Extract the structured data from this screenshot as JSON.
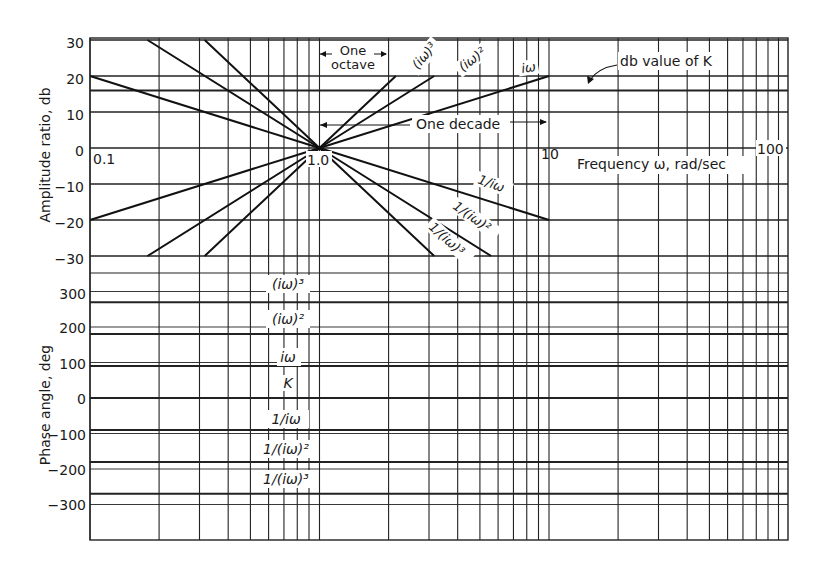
{
  "chart_data": {
    "type": "line",
    "title": "",
    "xlabel": "Frequency ω, rad/sec",
    "xscale": "log",
    "xlim": [
      0.1,
      100
    ],
    "x_tick_labels": [
      "0.1",
      "1.0",
      "10",
      "100"
    ],
    "panels": [
      {
        "name": "amplitude",
        "ylabel": "Amplitude ratio, db",
        "ylim": [
          -30,
          30
        ],
        "y_ticks": [
          30,
          20,
          10,
          0,
          -10,
          -20,
          -30
        ],
        "series": [
          {
            "name": "(iω)³",
            "slope_db_per_decade": 60,
            "x": [
              0.316,
              1.0,
              2.15
            ],
            "y": [
              -30,
              0,
              20
            ]
          },
          {
            "name": "(iω)²",
            "slope_db_per_decade": 40,
            "x": [
              0.178,
              1.0,
              3.16
            ],
            "y": [
              -30,
              0,
              20
            ]
          },
          {
            "name": "iω",
            "slope_db_per_decade": 20,
            "x": [
              0.1,
              1.0,
              10
            ],
            "y": [
              -20,
              0,
              20
            ]
          },
          {
            "name": "1/iω",
            "slope_db_per_decade": -20,
            "x": [
              0.1,
              1.0,
              10
            ],
            "y": [
              20,
              0,
              -20
            ]
          },
          {
            "name": "1/(iω)²",
            "slope_db_per_decade": -40,
            "x": [
              0.178,
              1.0,
              5.6
            ],
            "y": [
              30,
              0,
              -30
            ]
          },
          {
            "name": "1/(iω)³",
            "slope_db_per_decade": -60,
            "x": [
              0.316,
              1.0,
              3.16
            ],
            "y": [
              30,
              0,
              -30
            ]
          },
          {
            "name": "db value of K",
            "x": [
              0.1,
              100
            ],
            "y": [
              16,
              16
            ]
          }
        ]
      },
      {
        "name": "phase",
        "ylabel": "Phase angle, deg",
        "ylim": [
          -330,
          330
        ],
        "y_ticks": [
          300,
          200,
          100,
          0,
          -100,
          -200,
          -300
        ],
        "series": [
          {
            "name": "(iω)³",
            "value_deg": 270
          },
          {
            "name": "(iω)²",
            "value_deg": 180
          },
          {
            "name": "iω",
            "value_deg": 90
          },
          {
            "name": "K",
            "value_deg": 0
          },
          {
            "name": "1/iω",
            "value_deg": -90
          },
          {
            "name": "1/(iω)²",
            "value_deg": -180
          },
          {
            "name": "1/(iω)³",
            "value_deg": -270
          }
        ]
      }
    ],
    "annotations": [
      "One octave",
      "One decade",
      "db value of K"
    ],
    "grid": true
  },
  "labels": {
    "amp_ylabel": "Amplitude ratio, db",
    "phase_ylabel": "Phase angle, deg",
    "xlabel": "Frequency ω, rad/sec",
    "one": "One",
    "octave": "octave",
    "one_decade": "One decade",
    "db_k": "db value of K",
    "amp_ticks": [
      "30",
      "20",
      "10",
      "0",
      "−10",
      "−20",
      "−30"
    ],
    "phase_ticks": [
      "300",
      "200",
      "100",
      "0",
      "−100",
      "−200",
      "−300"
    ],
    "x_ticks": [
      "0.1",
      "1.0",
      "10",
      "100"
    ],
    "amp_curves": {
      "iw3": "(iω)³",
      "iw2": "(iω)²",
      "iw": "iω",
      "inv_iw": "1/iω",
      "inv_iw2": "1/(iω)²",
      "inv_iw3": "1/(iω)³"
    },
    "phase_curves": [
      "(iω)³",
      "(iω)²",
      "iω",
      "K",
      "1/iω",
      "1/(iω)²",
      "1/(iω)³"
    ]
  }
}
